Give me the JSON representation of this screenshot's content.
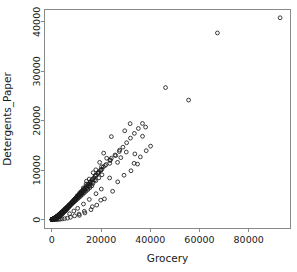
{
  "chart_data": {
    "type": "scatter",
    "title": "",
    "xlabel": "Grocery",
    "ylabel": "Detergents_Paper",
    "xlim": [
      -3000,
      97000
    ],
    "ylim": [
      -1800,
      42500
    ],
    "xticks": [
      0,
      20000,
      40000,
      60000,
      80000
    ],
    "yticks": [
      0,
      10000,
      20000,
      30000,
      40000
    ],
    "xtick_labels": [
      "0",
      "20000",
      "40000",
      "60000",
      "80000"
    ],
    "ytick_labels": [
      "0",
      "10000",
      "20000",
      "30000",
      "40000"
    ],
    "grid": false,
    "legend": null,
    "marker": "open-circle",
    "marker_color": "#1a1a1a",
    "n_points": 440,
    "points": [
      [
        92780,
        40827
      ],
      [
        67298,
        37755
      ],
      [
        55571,
        24171
      ],
      [
        46197,
        26701
      ],
      [
        36847,
        16853
      ],
      [
        38102,
        18711
      ],
      [
        31812,
        19410
      ],
      [
        29627,
        17965
      ],
      [
        24171,
        16784
      ],
      [
        21042,
        13446
      ],
      [
        26704,
        11577
      ],
      [
        22272,
        12422
      ],
      [
        30243,
        13661
      ],
      [
        19410,
        11577
      ],
      [
        17866,
        10069
      ],
      [
        24171,
        12422
      ],
      [
        16784,
        9490
      ],
      [
        33731,
        13287
      ],
      [
        28021,
        12531
      ],
      [
        20170,
        10680
      ],
      [
        15165,
        8201
      ],
      [
        14067,
        7770
      ],
      [
        19088,
        9633
      ],
      [
        23527,
        11390
      ],
      [
        12747,
        6410
      ],
      [
        11380,
        5441
      ],
      [
        13902,
        7193
      ],
      [
        17640,
        8917
      ],
      [
        10253,
        4778
      ],
      [
        9507,
        4015
      ],
      [
        12110,
        5766
      ],
      [
        15418,
        7391
      ],
      [
        8796,
        3622
      ],
      [
        8110,
        3290
      ],
      [
        10811,
        4982
      ],
      [
        13217,
        6113
      ],
      [
        7440,
        2810
      ],
      [
        6822,
        2455
      ],
      [
        9271,
        4120
      ],
      [
        11766,
        5310
      ],
      [
        6260,
        2120
      ],
      [
        5710,
        1850
      ],
      [
        7980,
        3340
      ],
      [
        10130,
        4560
      ],
      [
        5210,
        1620
      ],
      [
        4740,
        1380
      ],
      [
        6910,
        2740
      ],
      [
        8720,
        3810
      ],
      [
        4310,
        1180
      ],
      [
        3900,
        1010
      ],
      [
        5930,
        2210
      ],
      [
        7530,
        3100
      ],
      [
        3520,
        880
      ],
      [
        3180,
        740
      ],
      [
        5080,
        1790
      ],
      [
        6480,
        2510
      ],
      [
        2870,
        630
      ],
      [
        2580,
        540
      ],
      [
        4340,
        1440
      ],
      [
        5550,
        2030
      ],
      [
        2320,
        460
      ],
      [
        2080,
        390
      ],
      [
        3700,
        1160
      ],
      [
        4740,
        1640
      ],
      [
        1870,
        330
      ],
      [
        1670,
        280
      ],
      [
        3150,
        930
      ],
      [
        4040,
        1320
      ],
      [
        1490,
        240
      ],
      [
        1330,
        200
      ],
      [
        2680,
        750
      ],
      [
        3440,
        1060
      ],
      [
        1180,
        170
      ],
      [
        1050,
        145
      ],
      [
        2270,
        600
      ],
      [
        2930,
        850
      ],
      [
        930,
        125
      ],
      [
        820,
        105
      ],
      [
        1920,
        480
      ],
      [
        2490,
        680
      ],
      [
        725,
        90
      ],
      [
        640,
        78
      ],
      [
        1620,
        385
      ],
      [
        2110,
        545
      ],
      [
        565,
        66
      ],
      [
        495,
        56
      ],
      [
        1365,
        305
      ],
      [
        1790,
        435
      ],
      [
        432,
        48
      ],
      [
        378,
        41
      ],
      [
        1145,
        243
      ],
      [
        1510,
        347
      ],
      [
        328,
        35
      ],
      [
        285,
        30
      ],
      [
        955,
        192
      ],
      [
        1270,
        276
      ],
      [
        247,
        25
      ],
      [
        213,
        21
      ],
      [
        795,
        152
      ],
      [
        1065,
        219
      ],
      [
        183,
        18
      ],
      [
        157,
        15
      ],
      [
        658,
        119
      ],
      [
        890,
        173
      ],
      [
        134,
        12
      ],
      [
        114,
        10
      ],
      [
        543,
        93
      ],
      [
        740,
        136
      ],
      [
        97,
        9
      ],
      [
        82,
        7
      ],
      [
        447,
        72
      ],
      [
        614,
        106
      ],
      [
        69,
        6
      ],
      [
        58,
        5
      ],
      [
        366,
        56
      ],
      [
        507,
        82
      ],
      [
        3400,
        1250
      ],
      [
        4120,
        1510
      ],
      [
        2750,
        980
      ],
      [
        5320,
        2180
      ],
      [
        6150,
        2530
      ],
      [
        7010,
        2980
      ],
      [
        8340,
        3560
      ],
      [
        9180,
        4030
      ],
      [
        2430,
        820
      ],
      [
        1980,
        650
      ],
      [
        1620,
        510
      ],
      [
        1310,
        400
      ],
      [
        10420,
        4720
      ],
      [
        11630,
        5340
      ],
      [
        12840,
        6020
      ],
      [
        14110,
        6810
      ],
      [
        3740,
        1420
      ],
      [
        4510,
        1720
      ],
      [
        5290,
        2050
      ],
      [
        6080,
        2410
      ],
      [
        15620,
        7620
      ],
      [
        17130,
        8450
      ],
      [
        18710,
        9320
      ],
      [
        20340,
        10210
      ],
      [
        7120,
        2920
      ],
      [
        8240,
        3470
      ],
      [
        9420,
        4110
      ],
      [
        10680,
        4810
      ],
      [
        22040,
        11140
      ],
      [
        23810,
        12080
      ],
      [
        25650,
        13060
      ],
      [
        27560,
        14070
      ],
      [
        1120,
        330
      ],
      [
        950,
        270
      ],
      [
        810,
        220
      ],
      [
        690,
        180
      ],
      [
        12010,
        5560
      ],
      [
        13420,
        6350
      ],
      [
        14910,
        7190
      ],
      [
        16480,
        8070
      ],
      [
        580,
        145
      ],
      [
        490,
        118
      ],
      [
        410,
        95
      ],
      [
        345,
        76
      ],
      [
        18130,
        8990
      ],
      [
        19860,
        9950
      ],
      [
        21670,
        10940
      ],
      [
        23560,
        11970
      ],
      [
        290,
        61
      ],
      [
        242,
        49
      ],
      [
        202,
        39
      ],
      [
        168,
        31
      ],
      [
        3080,
        1090
      ],
      [
        3620,
        1330
      ],
      [
        4210,
        1590
      ],
      [
        4840,
        1870
      ],
      [
        139,
        25
      ],
      [
        115,
        20
      ],
      [
        95,
        16
      ],
      [
        78,
        13
      ],
      [
        5510,
        2170
      ],
      [
        6220,
        2490
      ],
      [
        6970,
        2830
      ],
      [
        7760,
        3190
      ],
      [
        2140,
        690
      ],
      [
        1840,
        570
      ],
      [
        1570,
        470
      ],
      [
        1330,
        385
      ],
      [
        8590,
        3570
      ],
      [
        9460,
        3970
      ],
      [
        10370,
        4390
      ],
      [
        11320,
        4830
      ],
      [
        1125,
        315
      ],
      [
        945,
        255
      ],
      [
        790,
        206
      ],
      [
        655,
        165
      ],
      [
        12310,
        5290
      ],
      [
        13340,
        5770
      ],
      [
        14410,
        6270
      ],
      [
        15520,
        6790
      ],
      [
        540,
        132
      ],
      [
        443,
        105
      ],
      [
        361,
        83
      ],
      [
        292,
        65
      ],
      [
        16670,
        7330
      ],
      [
        17860,
        7890
      ],
      [
        19090,
        8470
      ],
      [
        20360,
        9070
      ],
      [
        235,
        50
      ],
      [
        187,
        38
      ],
      [
        148,
        29
      ],
      [
        116,
        22
      ],
      [
        2960,
        1010
      ],
      [
        3410,
        1210
      ],
      [
        3890,
        1430
      ],
      [
        4400,
        1670
      ],
      [
        90,
        16
      ],
      [
        70,
        12
      ],
      [
        54,
        9
      ],
      [
        41,
        6
      ],
      [
        4940,
        1930
      ],
      [
        5510,
        2210
      ],
      [
        6110,
        2510
      ],
      [
        6740,
        2830
      ],
      [
        1980,
        610
      ],
      [
        1720,
        505
      ],
      [
        1480,
        415
      ],
      [
        1260,
        340
      ],
      [
        7400,
        3170
      ],
      [
        8090,
        3530
      ],
      [
        8810,
        3910
      ],
      [
        9560,
        4310
      ],
      [
        1060,
        277
      ],
      [
        880,
        224
      ],
      [
        720,
        180
      ],
      [
        580,
        143
      ],
      [
        10340,
        4730
      ],
      [
        11150,
        5170
      ],
      [
        11990,
        5630
      ],
      [
        12860,
        6110
      ],
      [
        462,
        113
      ],
      [
        362,
        88
      ],
      [
        280,
        67
      ],
      [
        212,
        50
      ],
      [
        13760,
        6610
      ],
      [
        14690,
        7130
      ],
      [
        15650,
        7670
      ],
      [
        16640,
        8230
      ],
      [
        157,
        36
      ],
      [
        113,
        25
      ],
      [
        79,
        17
      ],
      [
        53,
        11
      ],
      [
        2830,
        920
      ],
      [
        3240,
        1090
      ],
      [
        3670,
        1280
      ],
      [
        4120,
        1480
      ],
      [
        17660,
        8810
      ],
      [
        18710,
        9410
      ],
      [
        19790,
        10030
      ],
      [
        20900,
        10670
      ],
      [
        4590,
        1690
      ],
      [
        5080,
        1910
      ],
      [
        5590,
        2150
      ],
      [
        6120,
        2400
      ],
      [
        1840,
        540
      ],
      [
        1610,
        455
      ],
      [
        1400,
        380
      ],
      [
        1210,
        315
      ],
      [
        6670,
        2660
      ],
      [
        7240,
        2940
      ],
      [
        7830,
        3230
      ],
      [
        8440,
        3530
      ],
      [
        1040,
        260
      ],
      [
        885,
        212
      ],
      [
        745,
        172
      ],
      [
        620,
        138
      ],
      [
        9070,
        3840
      ],
      [
        9720,
        4170
      ],
      [
        10390,
        4510
      ],
      [
        11080,
        4860
      ],
      [
        510,
        110
      ],
      [
        413,
        87
      ],
      [
        328,
        68
      ],
      [
        255,
        52
      ],
      [
        11790,
        5220
      ],
      [
        12520,
        5590
      ],
      [
        13270,
        5970
      ],
      [
        14040,
        6360
      ],
      [
        193,
        39
      ],
      [
        142,
        28
      ],
      [
        101,
        20
      ],
      [
        69,
        13
      ],
      [
        2710,
        850
      ],
      [
        3080,
        1000
      ],
      [
        3470,
        1160
      ],
      [
        3880,
        1330
      ],
      [
        14830,
        6760
      ],
      [
        15640,
        7170
      ],
      [
        16470,
        7590
      ],
      [
        17320,
        8020
      ],
      [
        4310,
        1510
      ],
      [
        4760,
        1700
      ],
      [
        5230,
        1900
      ],
      [
        5720,
        2110
      ],
      [
        1710,
        485
      ],
      [
        1500,
        410
      ],
      [
        1310,
        345
      ],
      [
        1140,
        288
      ],
      [
        6230,
        2330
      ],
      [
        6760,
        2560
      ],
      [
        7310,
        2800
      ],
      [
        7880,
        3050
      ],
      [
        985,
        238
      ],
      [
        845,
        195
      ],
      [
        720,
        159
      ],
      [
        610,
        128
      ],
      [
        8470,
        3310
      ],
      [
        9080,
        3580
      ],
      [
        9710,
        3860
      ],
      [
        10360,
        4150
      ],
      [
        513,
        102
      ],
      [
        428,
        81
      ],
      [
        354,
        64
      ],
      [
        290,
        50
      ],
      [
        11030,
        4450
      ],
      [
        11720,
        4760
      ],
      [
        12430,
        5080
      ],
      [
        13160,
        5410
      ],
      [
        235,
        38
      ],
      [
        189,
        29
      ],
      [
        150,
        22
      ],
      [
        117,
        16
      ],
      [
        2600,
        790
      ],
      [
        2940,
        920
      ],
      [
        3290,
        1060
      ],
      [
        3650,
        1210
      ],
      [
        13910,
        5750
      ],
      [
        14680,
        6100
      ],
      [
        15470,
        6460
      ],
      [
        16280,
        6830
      ],
      [
        4020,
        1370
      ],
      [
        4400,
        1540
      ],
      [
        4790,
        1720
      ],
      [
        5190,
        1910
      ],
      [
        1590,
        440
      ],
      [
        1410,
        375
      ],
      [
        1240,
        317
      ],
      [
        1080,
        266
      ],
      [
        5600,
        2110
      ],
      [
        6020,
        2320
      ],
      [
        6450,
        2540
      ],
      [
        6890,
        2770
      ],
      [
        935,
        221
      ],
      [
        805,
        182
      ],
      [
        690,
        149
      ],
      [
        585,
        121
      ],
      [
        7340,
        3010
      ],
      [
        7800,
        3260
      ],
      [
        8270,
        3520
      ],
      [
        8750,
        3790
      ],
      [
        490,
        97
      ],
      [
        408,
        77
      ],
      [
        336,
        61
      ],
      [
        274,
        47
      ],
      [
        9240,
        4070
      ],
      [
        9740,
        4360
      ],
      [
        10250,
        4660
      ],
      [
        10770,
        4970
      ],
      [
        220,
        36
      ],
      [
        175,
        27
      ],
      [
        137,
        20
      ],
      [
        106,
        14
      ],
      [
        25980,
        12950
      ],
      [
        27410,
        13780
      ],
      [
        28880,
        14650
      ],
      [
        30390,
        15550
      ],
      [
        31940,
        16480
      ],
      [
        33530,
        17440
      ],
      [
        35160,
        18430
      ],
      [
        36830,
        19450
      ],
      [
        23480,
        8420
      ],
      [
        20100,
        6180
      ],
      [
        17930,
        5240
      ],
      [
        15210,
        4080
      ],
      [
        12840,
        3150
      ],
      [
        10470,
        2280
      ],
      [
        8930,
        1740
      ],
      [
        7210,
        1190
      ],
      [
        29340,
        8970
      ],
      [
        26750,
        7640
      ],
      [
        19860,
        3920
      ],
      [
        16430,
        2610
      ],
      [
        13180,
        1680
      ],
      [
        11020,
        1120
      ],
      [
        9240,
        760
      ],
      [
        7580,
        480
      ],
      [
        34820,
        11230
      ],
      [
        32150,
        9880
      ],
      [
        24690,
        5730
      ],
      [
        21370,
        4190
      ],
      [
        18240,
        2940
      ],
      [
        15890,
        2010
      ],
      [
        13420,
        1340
      ],
      [
        11190,
        860
      ],
      [
        6340,
        290
      ],
      [
        5120,
        195
      ],
      [
        4180,
        132
      ],
      [
        3360,
        88
      ],
      [
        2710,
        58
      ],
      [
        2140,
        39
      ],
      [
        1680,
        26
      ],
      [
        1290,
        17
      ],
      [
        40120,
        14860
      ],
      [
        38340,
        13940
      ],
      [
        35970,
        12680
      ],
      [
        33410,
        11380
      ]
    ]
  }
}
